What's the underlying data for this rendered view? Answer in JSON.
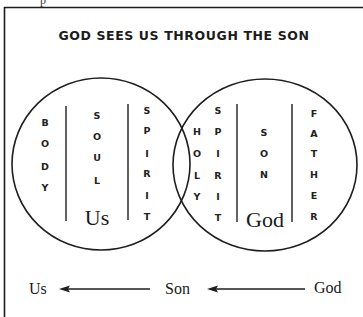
{
  "diagram": {
    "title": "GOD SEES US THROUGH THE SON",
    "top_cut_glyph": "p",
    "left_circle": {
      "label": "Us",
      "columns": [
        {
          "name": "body",
          "letters": [
            "B",
            "O",
            "D",
            "Y"
          ]
        },
        {
          "name": "soul",
          "letters": [
            "S",
            "O",
            "U",
            "L"
          ]
        },
        {
          "name": "spirit",
          "letters": [
            "S",
            "P",
            "I",
            "R",
            "I",
            "T"
          ]
        }
      ]
    },
    "right_circle": {
      "label": "God",
      "columns": [
        {
          "name": "holy",
          "letters": [
            "H",
            "O",
            "L",
            "Y"
          ]
        },
        {
          "name": "spirit",
          "letters": [
            "S",
            "P",
            "I",
            "R",
            "I",
            "T"
          ]
        },
        {
          "name": "son",
          "letters": [
            "S",
            "O",
            "N"
          ]
        },
        {
          "name": "father",
          "letters": [
            "F",
            "A",
            "T",
            "H",
            "E",
            "R"
          ]
        }
      ]
    },
    "flow": {
      "left": "Us",
      "middle": "Son",
      "right": "God"
    },
    "colors": {
      "line": "#1e1e1e",
      "text": "#1a1a1a",
      "background": "#ffffff"
    }
  }
}
